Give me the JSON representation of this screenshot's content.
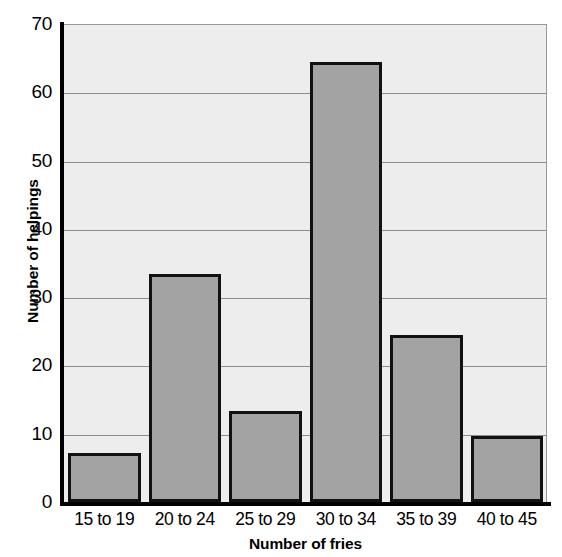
{
  "chart_data": {
    "type": "bar",
    "title": "",
    "xlabel": "Number of fries",
    "ylabel": "Number of helpings",
    "categories": [
      "15 to 19",
      "20 to 24",
      "25 to 29",
      "30 to 34",
      "35 to 39",
      "40 to 45"
    ],
    "values": [
      7.2,
      33.4,
      13.4,
      64.4,
      24.4,
      9.6
    ],
    "ylim": [
      0,
      70
    ],
    "ytick_labels": [
      "0",
      "10",
      "20",
      "30",
      "40",
      "50",
      "60",
      "70"
    ],
    "ytick_values": [
      0,
      10,
      20,
      30,
      40,
      50,
      60,
      70
    ],
    "grid": true,
    "grid_axis": "y",
    "legend": null,
    "legend_position": "none",
    "series": [
      {
        "name": "Number of helpings",
        "values": [
          7.2,
          33.4,
          13.4,
          64.4,
          24.4,
          9.6
        ]
      }
    ],
    "annotations": []
  },
  "style": {
    "bar_fill": "#a3a3a3",
    "bar_edge": "#111111",
    "plot_background": "#ededed",
    "gridline_color": "#8c8c8c",
    "axis_color": "#000000",
    "page_background": "#ffffff",
    "text_color": "#000000"
  }
}
